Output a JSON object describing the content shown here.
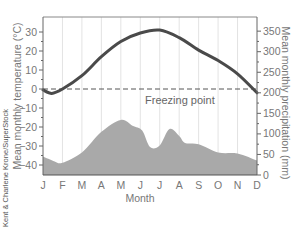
{
  "chart_data": {
    "type": "line+area",
    "title": "",
    "xlabel": "Month",
    "ylabel_left": "Mean monthly temperature (°C)",
    "ylabel_right": "Mean monthly precipitation (mm)",
    "categories": [
      "J",
      "F",
      "M",
      "A",
      "M",
      "J",
      "J",
      "A",
      "S",
      "O",
      "N",
      "D"
    ],
    "series": [
      {
        "name": "Mean monthly temperature",
        "type": "line",
        "axis": "left",
        "unit": "°C",
        "color": "#4a4a4a",
        "values": [
          -0.5,
          0,
          7,
          17,
          25,
          29.5,
          31,
          27,
          20.5,
          15,
          8,
          -2
        ]
      },
      {
        "name": "Mean monthly precipitation",
        "type": "area",
        "axis": "right",
        "unit": "mm",
        "color": "#a9a9a9",
        "values": [
          45,
          30,
          55,
          105,
          134,
          108,
          72,
          95,
          75,
          55,
          52,
          35
        ]
      }
    ],
    "left_axis": {
      "ylim": [
        -45,
        38
      ],
      "ticks": [
        30,
        20,
        10,
        0,
        -10,
        -20,
        -30,
        -40
      ]
    },
    "right_axis": {
      "ylim": [
        0,
        380
      ],
      "ticks": [
        350,
        300,
        250,
        200,
        150,
        100,
        50,
        0
      ]
    },
    "reference_line": {
      "label": "Freezing point",
      "value": 0,
      "axis": "left",
      "style": "dashed"
    },
    "grid": {
      "vertical": true,
      "horizontal": false
    },
    "legend": "none"
  },
  "labels": {
    "xlabel": "Month",
    "ylabel_left": "Mean monthly temperature (°C)",
    "ylabel_right": "Mean monthly precipitation (mm)",
    "freezing": "Freezing point",
    "credit": "Kent & Charlene Krone/SuperStock"
  },
  "ticks": {
    "left": [
      "30",
      "20",
      "10",
      "0",
      "−10",
      "−20",
      "−30",
      "−40"
    ],
    "right": [
      "350",
      "300",
      "250",
      "200",
      "150",
      "100",
      "50",
      "0"
    ],
    "months": [
      "J",
      "F",
      "M",
      "A",
      "M",
      "J",
      "J",
      "A",
      "S",
      "O",
      "N",
      "D"
    ]
  },
  "colors": {
    "temperature_line": "#4a4a4a",
    "precip_fill": "#a9a9a9",
    "axis": "#666666",
    "grid": "#e3e3e3"
  }
}
